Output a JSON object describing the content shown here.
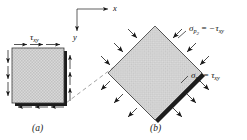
{
  "figure": {
    "background_color": "#ffffff",
    "ink_color": "#1a1a1a",
    "element_fill_color": "#d8d8d8",
    "element_edge_color": "#2b2b2b",
    "shadow_color": "#000000"
  },
  "axes": {
    "x_label": "x",
    "y_label": "y",
    "origin": {
      "x": 77,
      "y": 9
    },
    "x_tip": {
      "x": 110,
      "y": 9
    },
    "y_tip": {
      "x": 77,
      "y": 33
    }
  },
  "panel_a": {
    "caption": "(a)",
    "shear_label": {
      "symbol": "τ",
      "subscript": "xy"
    },
    "description": "Square element in pure shear with shear arrows on all four faces",
    "square": {
      "x": 12,
      "y": 48,
      "width": 52,
      "height": 56
    },
    "arrow_count_per_face": 3
  },
  "panel_b": {
    "caption": "(b)",
    "description": "Rotated 45 degree element showing principal tensile and compressive stresses",
    "diamond_center": {
      "x": 155,
      "y": 73
    },
    "diamond_half_diagonal": 47,
    "labels": [
      {
        "id": "sigma-p2",
        "symbol": "σ",
        "subscript": "p",
        "subsubscript": "2",
        "equals": "=",
        "value_sign": "−",
        "value_symbol": "τ",
        "value_subscript": "xy",
        "full_text": "σp2 = −τxy",
        "meaning": "compressive principal stress",
        "position": {
          "x": 188,
          "y": 32
        }
      },
      {
        "id": "sigma-p1",
        "symbol": "σ",
        "subscript": "p",
        "subsubscript": "1",
        "equals": "=",
        "value_sign": "",
        "value_symbol": "τ",
        "value_subscript": "xy",
        "full_text": "σp1 = τxy",
        "meaning": "tensile principal stress",
        "position": {
          "x": 190,
          "y": 79
        }
      }
    ]
  },
  "connector": {
    "style": "dashed",
    "from": {
      "x": 66,
      "y": 102
    },
    "to": {
      "x": 120,
      "y": 62
    }
  }
}
